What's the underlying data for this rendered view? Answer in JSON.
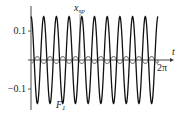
{
  "chart_data": {
    "type": "line",
    "title": "",
    "xlabel": "t",
    "ylabel": "",
    "x_range": [
      0,
      6.2832
    ],
    "ylim": [
      -0.16,
      0.16
    ],
    "grid": false,
    "legend": "none (inline curve labels)",
    "x_ticks": [
      {
        "value": 6.2832,
        "label": "2π"
      }
    ],
    "y_ticks": [
      {
        "value": 0.1,
        "label": "0.1"
      },
      {
        "value": -0.1,
        "label": "−0.1"
      }
    ],
    "series": [
      {
        "name": "F1",
        "label": "F",
        "label_sub": "1",
        "color": "#111111",
        "function": "0.15*cos(10*t)",
        "amplitude": 0.15,
        "periods": 10
      },
      {
        "name": "x_sp",
        "label": "x",
        "label_sub": "sp",
        "color": "#888888",
        "function": "-0.012*cos(10*t)",
        "amplitude": 0.012,
        "periods": 10
      }
    ],
    "annotations": [
      {
        "text": "x_sp",
        "near": "top, pointing at small gray curve"
      },
      {
        "text": "F_1",
        "near": "bottom, beside large black curve"
      }
    ]
  },
  "labels": {
    "y_pos": "0.1",
    "y_neg": "−0.1",
    "x_axis": "t",
    "x_end": "2π",
    "xsp_main": "x",
    "xsp_sub": "sp",
    "f1_main": "F",
    "f1_sub": "1"
  }
}
